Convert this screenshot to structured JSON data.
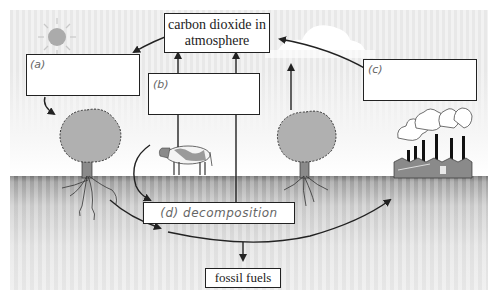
{
  "diagram": {
    "nodes": {
      "atmosphere": {
        "label": "carbon dioxide in atmosphere",
        "line1": "carbon dioxide in",
        "line2": "atmosphere"
      },
      "a": {
        "label": "(a)",
        "content": ""
      },
      "b": {
        "label": "(b)",
        "content": ""
      },
      "c": {
        "label": "(c)",
        "content": ""
      },
      "d": {
        "label": "(d) decomposition"
      },
      "fossil_fuels": {
        "label": "fossil fuels"
      }
    },
    "illustrations": [
      "sun-icon",
      "cloud-icon",
      "tree-left",
      "tree-right",
      "cow",
      "factory"
    ],
    "edges": [
      {
        "from": "atmosphere",
        "to": "a"
      },
      {
        "from": "a",
        "to": "tree-left"
      },
      {
        "from": "b",
        "to": "atmosphere"
      },
      {
        "from": "b",
        "to": "atmosphere"
      },
      {
        "from": "tree-right",
        "to": "atmosphere"
      },
      {
        "from": "c",
        "to": "atmosphere"
      },
      {
        "from": "cow",
        "to": "d"
      },
      {
        "from": "roots",
        "to": "ground-path"
      },
      {
        "from": "ground-path",
        "to": "factory"
      },
      {
        "from": "ground-path",
        "to": "fossil_fuels"
      }
    ],
    "colors": {
      "line": "#222222",
      "tree": "#a8a8a8",
      "ground_top": "#7a7a7a",
      "sky": "#ececec"
    }
  }
}
